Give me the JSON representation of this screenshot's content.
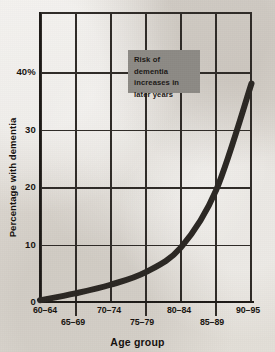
{
  "ghost_text": "",
  "annotation": {
    "text": "Risk of dementia increases in later years",
    "fill_color": "#8d8a85"
  },
  "chart_data": {
    "type": "line",
    "title": "",
    "xlabel": "Age group",
    "ylabel": "Percentage with dementia",
    "categories": [
      "60–64",
      "65–69",
      "70–74",
      "75–79",
      "80–84",
      "85–89",
      "90–95"
    ],
    "values": [
      0.3,
      1.5,
      3.0,
      5.2,
      9.5,
      19.5,
      38.0
    ],
    "ytick_labels": [
      "40%",
      "30",
      "20",
      "10",
      "0"
    ],
    "ytick_values": [
      40,
      30,
      20,
      10,
      0
    ],
    "ylim": [
      0,
      48
    ],
    "xlim": [
      0,
      6
    ],
    "grid": true,
    "legend": "none",
    "line_color": "#2b2723",
    "line_width": 6,
    "annotations": [
      "Risk of dementia increases in later years"
    ]
  }
}
